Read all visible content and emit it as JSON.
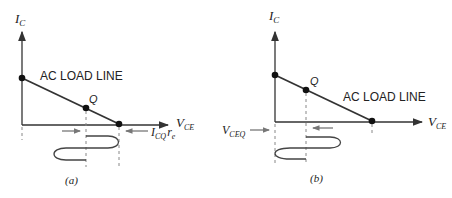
{
  "panels": [
    {
      "id": "a",
      "caption": "(a)",
      "y_axis_label": "I",
      "y_axis_sub": "C",
      "x_axis_label": "V",
      "x_axis_sub": "CE",
      "load_line_label": "AC LOAD LINE",
      "q_label": "Q",
      "annotation_main": "I",
      "annotation_sub": "CQ",
      "annotation_tail": "r",
      "annotation_tail_sub": "e"
    },
    {
      "id": "b",
      "caption": "(b)",
      "y_axis_label": "I",
      "y_axis_sub": "C",
      "x_axis_label": "V",
      "x_axis_sub": "CE",
      "load_line_label": "AC LOAD LINE",
      "q_label": "Q",
      "annotation_main": "V",
      "annotation_sub": "CEQ"
    }
  ],
  "colors": {
    "line": "#333333",
    "dash": "#888888",
    "arrow": "#777777"
  }
}
